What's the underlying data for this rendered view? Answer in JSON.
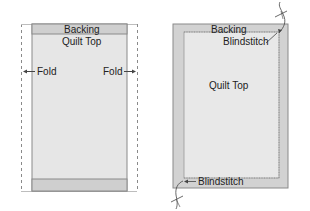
{
  "left_diagram": {
    "backing_label": "Backing",
    "quilt_top_label": "Quilt Top",
    "fold_left_label": "Fold",
    "fold_right_label": "Fold"
  },
  "right_diagram": {
    "backing_label": "Backing",
    "blindstitch_top_label": "Blindstitch",
    "quilt_top_label": "Quilt Top",
    "blindstitch_bottom_label": "Blindstitch"
  },
  "colors": {
    "backing": "#d2d2d2",
    "quilt_top": "#e8e8e8",
    "outline": "#8a8a8a",
    "text": "#222222"
  }
}
